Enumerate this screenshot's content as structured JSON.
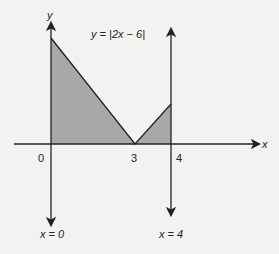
{
  "figure": {
    "equation_label": "y = |2x − 6|",
    "x_axis_label": "x",
    "y_axis_label": "y",
    "ticks": {
      "zero": "0",
      "three": "3",
      "four": "4"
    },
    "line_labels": {
      "x0": "x = 0",
      "x4": "x = 4"
    },
    "fill_color": "#a8a8a8",
    "line_color": "#222222"
  }
}
